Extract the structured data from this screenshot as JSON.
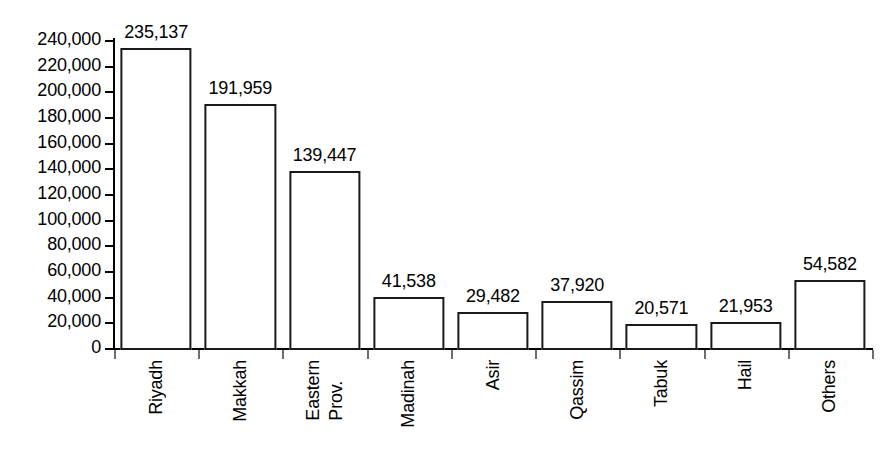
{
  "chart_data": {
    "type": "bar",
    "title": "",
    "subtitle": "",
    "xlabel": "",
    "ylabel": "",
    "categories": [
      "Riyadh",
      "Makkah",
      "Eastern Prov.",
      "Madinah",
      "Asir",
      "Qassim",
      "Tabuk",
      "Hail",
      "Others"
    ],
    "category_lines": [
      [
        "Riyadh"
      ],
      [
        "Makkah"
      ],
      [
        "Eastern",
        "Prov."
      ],
      [
        "Madinah"
      ],
      [
        "Asir"
      ],
      [
        "Qassim"
      ],
      [
        "Tabuk"
      ],
      [
        "Hail"
      ],
      [
        "Others"
      ]
    ],
    "values": [
      235137,
      191959,
      139447,
      41538,
      29482,
      37920,
      20571,
      21953,
      54582
    ],
    "value_labels": [
      "235,137",
      "191,959",
      "139,447",
      "41,538",
      "29,482",
      "37,920",
      "20,571",
      "21,953",
      "54,582"
    ],
    "ylim": [
      0,
      240000
    ],
    "ytick_step": 20000,
    "ytick_values": [
      240000,
      220000,
      200000,
      180000,
      160000,
      140000,
      120000,
      100000,
      80000,
      60000,
      40000,
      20000,
      0
    ],
    "ytick_labels": [
      "240,000",
      "220,000",
      "200,000",
      "180,000",
      "160,000",
      "140,000",
      "120,000",
      "100,000",
      "80,000",
      "60,000",
      "40,000",
      "20,000",
      "0"
    ],
    "grid": false,
    "legend": null,
    "legend_position": "none",
    "bar_fill_color": "#ffffff",
    "bar_border_color": "#1a1a1a",
    "axis_color": "#000000",
    "text_color": "#000000",
    "background_color": "#ffffff",
    "data_labels_shown": true,
    "x_label_rotation_degrees": 90
  }
}
